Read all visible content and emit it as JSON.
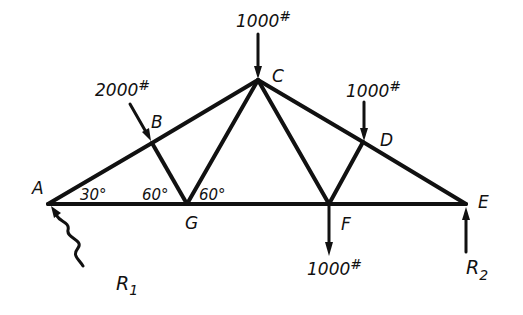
{
  "diagram": {
    "type": "roof truss free-body diagram",
    "nodes": [
      {
        "id": "A",
        "label": "A",
        "x": 48,
        "y": 204,
        "lx": 20,
        "ly": 194
      },
      {
        "id": "B",
        "label": "B",
        "x": 152,
        "y": 143,
        "lx": 152,
        "ly": 126
      },
      {
        "id": "C",
        "label": "C",
        "x": 258,
        "y": 80,
        "lx": 272,
        "ly": 81
      },
      {
        "id": "D",
        "label": "D",
        "x": 363,
        "y": 142,
        "lx": 378,
        "ly": 146
      },
      {
        "id": "E",
        "label": "E",
        "x": 466,
        "y": 204,
        "lx": 480,
        "ly": 202
      },
      {
        "id": "F",
        "label": "F",
        "x": 329,
        "y": 204,
        "lx": 343,
        "ly": 227
      },
      {
        "id": "G",
        "label": "G",
        "x": 187,
        "y": 204,
        "lx": 185,
        "ly": 228
      }
    ],
    "members": [
      [
        "A",
        "B"
      ],
      [
        "B",
        "C"
      ],
      [
        "C",
        "D"
      ],
      [
        "D",
        "E"
      ],
      [
        "A",
        "G"
      ],
      [
        "G",
        "F"
      ],
      [
        "F",
        "E"
      ],
      [
        "B",
        "G"
      ],
      [
        "G",
        "C"
      ],
      [
        "C",
        "F"
      ],
      [
        "F",
        "D"
      ]
    ],
    "angles": [
      {
        "label": "30°",
        "x": 80,
        "y": 199
      },
      {
        "label": "60°",
        "x": 142,
        "y": 199
      },
      {
        "label": "60°",
        "x": 198,
        "y": 199
      }
    ],
    "loads": [
      {
        "label": "1000",
        "unit": "#",
        "node": "C",
        "direction": "down",
        "x1": 258,
        "y1": 34,
        "x2": 258,
        "y2": 78,
        "lx": 235,
        "ly": 26
      },
      {
        "label": "2000",
        "unit": "#",
        "node": "B",
        "direction": "inclined-down",
        "x1": 130,
        "y1": 104,
        "x2": 151,
        "y2": 141,
        "lx": 95,
        "ly": 96
      },
      {
        "label": "1000",
        "unit": "#",
        "node": "D",
        "direction": "down",
        "x1": 364,
        "y1": 102,
        "x2": 364,
        "y2": 140,
        "lx": 346,
        "ly": 97
      },
      {
        "label": "1000",
        "unit": "#",
        "node": "F",
        "direction": "down",
        "x1": 329,
        "y1": 206,
        "x2": 329,
        "y2": 255,
        "lx": 307,
        "ly": 275
      }
    ],
    "reactions": [
      {
        "label": "R",
        "subscript": "1",
        "node": "A",
        "lx": 115,
        "ly": 288
      },
      {
        "label": "R",
        "subscript": "2",
        "node": "E",
        "lx": 465,
        "ly": 274
      }
    ]
  },
  "text": {
    "node_A": "A",
    "node_B": "B",
    "node_C": "C",
    "node_D": "D",
    "node_E": "E",
    "node_F": "F",
    "node_G": "G",
    "angle_A": "30°",
    "angle_G_left": "60°",
    "angle_G_right": "60°",
    "load_C": "1000",
    "load_B": "2000",
    "load_D": "1000",
    "load_F": "1000",
    "load_unit": "#",
    "reaction_1": "R",
    "reaction_1_sub": "1",
    "reaction_2": "R",
    "reaction_2_sub": "2"
  },
  "colors": {
    "ink": "#111111",
    "background": "#ffffff"
  }
}
